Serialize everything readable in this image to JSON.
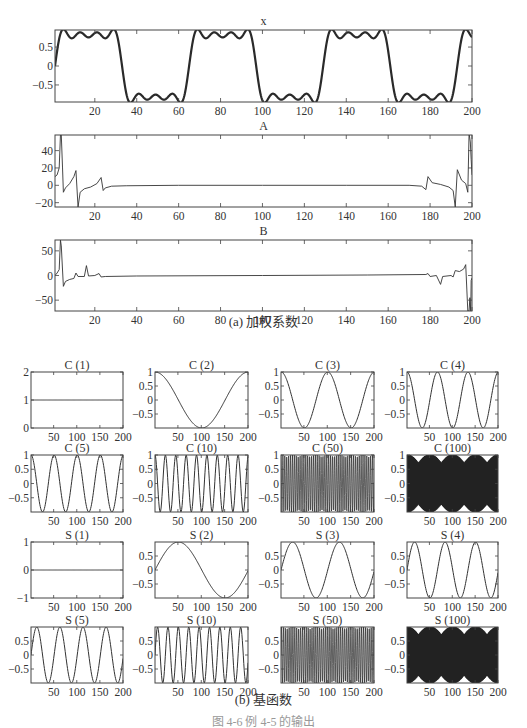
{
  "captions": {
    "part_a": "(a) 加权系数",
    "part_b": "(b) 基函数",
    "figure": "图 4-6 例 4-5 的输出"
  },
  "colors": {
    "axis": "#444444",
    "line": "#333333",
    "bold_line": "#2a2a2a",
    "dense_fill": "#222222",
    "background": "#ffffff"
  },
  "chart_data": [
    {
      "id": "x",
      "type": "line",
      "title": "x",
      "xlabel": "",
      "ylabel": "",
      "xlim": [
        1,
        200
      ],
      "ylim": [
        -0.95,
        0.95
      ],
      "xticks": [
        20,
        40,
        60,
        80,
        100,
        120,
        140,
        160,
        180,
        200
      ],
      "yticks": [
        -0.5,
        0,
        0.5
      ],
      "ytick_labels": [
        "−0.5",
        "0",
        "0.5"
      ],
      "grid": false,
      "description": "Square wave of period 64 (amplitude ~0.85) approximated by a truncated Fourier series, showing Gibbs ripples",
      "model": {
        "kind": "square_fourier",
        "period": 64,
        "amplitude": 1.0,
        "harmonics": [
          1,
          3,
          5,
          7
        ],
        "phase_start": 0
      },
      "line_width": 2.2
    },
    {
      "id": "A",
      "type": "line",
      "title": "A",
      "xlim": [
        1,
        200
      ],
      "ylim": [
        -25,
        58
      ],
      "xticks": [
        20,
        40,
        60,
        80,
        100,
        120,
        140,
        160,
        180,
        200
      ],
      "yticks": [
        -20,
        0,
        20,
        40
      ],
      "ytick_labels": [
        "−20",
        "0",
        "20",
        "40"
      ],
      "grid": false,
      "description": "Cosine weighting coefficients: near-zero except spikes near both ends",
      "points": [
        [
          1,
          10
        ],
        [
          2,
          12
        ],
        [
          3,
          20
        ],
        [
          3.6,
          58
        ],
        [
          4,
          58
        ],
        [
          4.6,
          20
        ],
        [
          5,
          -8
        ],
        [
          6,
          -3
        ],
        [
          8,
          2
        ],
        [
          10,
          10
        ],
        [
          11,
          17
        ],
        [
          12,
          -25
        ],
        [
          13,
          -8
        ],
        [
          15,
          -4
        ],
        [
          18,
          -2
        ],
        [
          21,
          2
        ],
        [
          23,
          9
        ],
        [
          24,
          -6
        ],
        [
          25,
          -3
        ],
        [
          28,
          -1
        ],
        [
          35,
          -0.5
        ],
        [
          60,
          0
        ],
        [
          100,
          0
        ],
        [
          140,
          0
        ],
        [
          170,
          0
        ],
        [
          176,
          -1
        ],
        [
          178,
          -5
        ],
        [
          179,
          10
        ],
        [
          181,
          3
        ],
        [
          185,
          1
        ],
        [
          189,
          -2
        ],
        [
          191,
          -6
        ],
        [
          192,
          -25
        ],
        [
          193,
          18
        ],
        [
          195,
          6
        ],
        [
          197,
          2
        ],
        [
          198,
          -8
        ],
        [
          198.6,
          60
        ],
        [
          199.2,
          50
        ],
        [
          199.6,
          30
        ],
        [
          200,
          12
        ]
      ],
      "line_width": 0.9
    },
    {
      "id": "B",
      "type": "line",
      "title": "B",
      "xlim": [
        1,
        200
      ],
      "ylim": [
        -72,
        72
      ],
      "xticks": [
        20,
        40,
        60,
        80,
        100,
        120,
        140,
        160,
        180,
        200
      ],
      "yticks": [
        -50,
        0,
        50
      ],
      "ytick_labels": [
        "−50",
        "0",
        "50"
      ],
      "grid": false,
      "description": "Sine weighting coefficients: near-zero except spikes near both ends",
      "points": [
        [
          1,
          0
        ],
        [
          2,
          5
        ],
        [
          3,
          12
        ],
        [
          3.6,
          72
        ],
        [
          4,
          60
        ],
        [
          5,
          -22
        ],
        [
          6,
          -12
        ],
        [
          8,
          -8
        ],
        [
          10,
          -6
        ],
        [
          11,
          5
        ],
        [
          12,
          -2
        ],
        [
          15,
          -2
        ],
        [
          16,
          20
        ],
        [
          17,
          -1
        ],
        [
          20,
          0
        ],
        [
          22,
          4
        ],
        [
          23,
          -3
        ],
        [
          25,
          -2
        ],
        [
          40,
          -1
        ],
        [
          100,
          0
        ],
        [
          150,
          1
        ],
        [
          178,
          2
        ],
        [
          179,
          4
        ],
        [
          180,
          -2
        ],
        [
          183,
          0
        ],
        [
          185,
          -18
        ],
        [
          186,
          -2
        ],
        [
          190,
          0
        ],
        [
          191,
          -3
        ],
        [
          192,
          10
        ],
        [
          194,
          8
        ],
        [
          196,
          13
        ],
        [
          197,
          22
        ],
        [
          198,
          -72
        ],
        [
          198.6,
          -72
        ],
        [
          199,
          -45
        ],
        [
          199.4,
          -72
        ],
        [
          199.6,
          -10
        ],
        [
          200,
          -5
        ]
      ],
      "line_width": 0.9
    },
    {
      "id": "C1",
      "type": "line",
      "title": "C (1)",
      "func": "cos",
      "k": 1,
      "xlim": [
        1,
        200
      ],
      "ylim": [
        0,
        2
      ],
      "yticks": [
        0,
        1,
        2
      ],
      "ytick_labels": [
        "0",
        "1",
        "2"
      ],
      "xticks": [
        50,
        100,
        150,
        200
      ],
      "values_rule": "constant 1"
    },
    {
      "id": "C2",
      "type": "line",
      "title": "C (2)",
      "func": "cos",
      "k": 2,
      "xlim": [
        1,
        200
      ],
      "ylim": [
        -1,
        1
      ],
      "yticks": [
        -0.5,
        0,
        0.5,
        1
      ],
      "ytick_labels": [
        "−0.5",
        "0",
        "0.5",
        "1"
      ],
      "xticks": [
        50,
        100,
        150,
        200
      ],
      "values_rule": "cos(2π(k−1)(n−1)/200)"
    },
    {
      "id": "C3",
      "type": "line",
      "title": "C (3)",
      "func": "cos",
      "k": 3,
      "xlim": [
        1,
        200
      ],
      "ylim": [
        -1,
        1
      ],
      "yticks": [
        -0.5,
        0,
        0.5,
        1
      ],
      "ytick_labels": [
        "−0.5",
        "0",
        "0.5",
        "1"
      ],
      "xticks": [
        50,
        100,
        150,
        200
      ]
    },
    {
      "id": "C4",
      "type": "line",
      "title": "C (4)",
      "func": "cos",
      "k": 4,
      "xlim": [
        1,
        200
      ],
      "ylim": [
        -1,
        1
      ],
      "yticks": [
        -0.5,
        0,
        0.5,
        1
      ],
      "ytick_labels": [
        "−0.5",
        "0",
        "0.5",
        "1"
      ],
      "xticks": [
        50,
        100,
        150,
        200
      ]
    },
    {
      "id": "C5",
      "type": "line",
      "title": "C (5)",
      "func": "cos",
      "k": 5,
      "xlim": [
        1,
        200
      ],
      "ylim": [
        -1,
        1
      ],
      "yticks": [
        -0.5,
        0,
        0.5,
        1
      ],
      "ytick_labels": [
        "−0.5",
        "0",
        "0.5",
        "1"
      ],
      "xticks": [
        50,
        100,
        150,
        200
      ]
    },
    {
      "id": "C10",
      "type": "line",
      "title": "C (10)",
      "func": "cos",
      "k": 10,
      "xlim": [
        1,
        200
      ],
      "ylim": [
        -1,
        1
      ],
      "yticks": [
        -0.5,
        0,
        0.5,
        1
      ],
      "ytick_labels": [
        "−0.5",
        "0",
        "0.5",
        "1"
      ],
      "xticks": [
        50,
        100,
        150,
        200
      ]
    },
    {
      "id": "C50",
      "type": "line",
      "title": "C (50)",
      "func": "cos",
      "k": 50,
      "xlim": [
        1,
        200
      ],
      "ylim": [
        -1,
        1
      ],
      "yticks": [
        -0.5,
        0,
        0.5,
        1
      ],
      "ytick_labels": [
        "−0.5",
        "0",
        "0.5",
        "1"
      ],
      "xticks": [
        50,
        100,
        150,
        200
      ]
    },
    {
      "id": "C100",
      "type": "line",
      "title": "C (100)",
      "func": "cos",
      "k": 100,
      "xlim": [
        1,
        200
      ],
      "ylim": [
        -1,
        1
      ],
      "yticks": [
        -0.5,
        0,
        0.5,
        1
      ],
      "ytick_labels": [
        "−0.5",
        "0",
        "0.5",
        "1"
      ],
      "xticks": [
        50,
        100,
        150,
        200
      ]
    },
    {
      "id": "S1",
      "type": "line",
      "title": "S (1)",
      "func": "sin",
      "k": 1,
      "xlim": [
        1,
        200
      ],
      "ylim": [
        -1,
        1
      ],
      "yticks": [
        -1,
        0,
        1
      ],
      "ytick_labels": [
        "−1",
        "0",
        "1"
      ],
      "xticks": [
        50,
        100,
        150,
        200
      ],
      "values_rule": "constant 0"
    },
    {
      "id": "S2",
      "type": "line",
      "title": "S (2)",
      "func": "sin",
      "k": 2,
      "xlim": [
        1,
        200
      ],
      "ylim": [
        -1,
        1
      ],
      "yticks": [
        -0.5,
        0,
        0.5
      ],
      "ytick_labels": [
        "−0.5",
        "0",
        "0.5"
      ],
      "xticks": [
        50,
        100,
        150,
        200
      ]
    },
    {
      "id": "S3",
      "type": "line",
      "title": "S (3)",
      "func": "sin",
      "k": 3,
      "xlim": [
        1,
        200
      ],
      "ylim": [
        -1,
        1
      ],
      "yticks": [
        -0.5,
        0,
        0.5
      ],
      "ytick_labels": [
        "−0.5",
        "0",
        "0.5"
      ],
      "xticks": [
        50,
        100,
        150,
        200
      ]
    },
    {
      "id": "S4",
      "type": "line",
      "title": "S (4)",
      "func": "sin",
      "k": 4,
      "xlim": [
        1,
        200
      ],
      "ylim": [
        -1,
        1
      ],
      "yticks": [
        -0.5,
        0,
        0.5
      ],
      "ytick_labels": [
        "−0.5",
        "0",
        "0.5"
      ],
      "xticks": [
        50,
        100,
        150,
        200
      ]
    },
    {
      "id": "S5",
      "type": "line",
      "title": "S (5)",
      "func": "sin",
      "k": 5,
      "xlim": [
        1,
        200
      ],
      "ylim": [
        -1,
        1
      ],
      "yticks": [
        -0.5,
        0,
        0.5
      ],
      "ytick_labels": [
        "−0.5",
        "0",
        "0.5"
      ],
      "xticks": [
        50,
        100,
        150,
        200
      ]
    },
    {
      "id": "S10",
      "type": "line",
      "title": "S (10)",
      "func": "sin",
      "k": 10,
      "xlim": [
        1,
        200
      ],
      "ylim": [
        -1,
        1
      ],
      "yticks": [
        -0.5,
        0,
        0.5
      ],
      "ytick_labels": [
        "−0.5",
        "0",
        "0.5"
      ],
      "xticks": [
        50,
        100,
        150,
        200
      ]
    },
    {
      "id": "S50",
      "type": "line",
      "title": "S (50)",
      "func": "sin",
      "k": 50,
      "xlim": [
        1,
        200
      ],
      "ylim": [
        -1,
        1
      ],
      "yticks": [
        -0.5,
        0,
        0.5
      ],
      "ytick_labels": [
        "−0.5",
        "0",
        "0.5"
      ],
      "xticks": [
        50,
        100,
        150,
        200
      ]
    },
    {
      "id": "S100",
      "type": "line",
      "title": "S (100)",
      "func": "sin",
      "k": 100,
      "xlim": [
        1,
        200
      ],
      "ylim": [
        -1,
        1
      ],
      "yticks": [
        -0.5,
        0,
        0.5
      ],
      "ytick_labels": [
        "−0.5",
        "0",
        "0.5"
      ],
      "xticks": [
        50,
        100,
        150,
        200
      ]
    }
  ],
  "layout": {
    "top_panels": [
      {
        "id": "x",
        "box": [
          55,
          30,
          472,
          102
        ],
        "title_y": 25
      },
      {
        "id": "A",
        "box": [
          55,
          135,
          472,
          207
        ],
        "title_y": 130
      },
      {
        "id": "B",
        "box": [
          55,
          240,
          472,
          311
        ],
        "title_y": 235
      }
    ],
    "grid_cols": [
      [
        31,
        123
      ],
      [
        155,
        248
      ],
      [
        281,
        374
      ],
      [
        407,
        498
      ]
    ],
    "grid_rows": [
      [
        372,
        428
      ],
      [
        455,
        512
      ],
      [
        542,
        598
      ],
      [
        627,
        683
      ]
    ],
    "grid_order": [
      [
        "C1",
        "C2",
        "C3",
        "C4"
      ],
      [
        "C5",
        "C10",
        "C50",
        "C100"
      ],
      [
        "S1",
        "S2",
        "S3",
        "S4"
      ],
      [
        "S5",
        "S10",
        "S50",
        "S100"
      ]
    ],
    "caption_a_y": 318,
    "caption_b_y": 696,
    "caption_fig_y": 718
  }
}
